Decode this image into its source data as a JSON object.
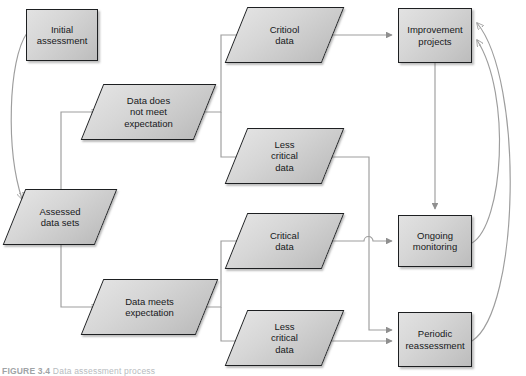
{
  "figure": {
    "caption_label": "FIGURE 3.4",
    "caption_text": "Data assessment process",
    "background_color": "#ffffff",
    "shape_fill": "#d6d6d6",
    "shape_border": "#1d1f21",
    "connector_color": "#9d9d9d",
    "text_color": "#16181a"
  },
  "nodes": {
    "initial_assessment": {
      "label": "Initial\nassessment",
      "shape": "rectangle",
      "x": 26,
      "y": 9,
      "w": 72,
      "h": 52
    },
    "assessed_data_sets": {
      "label": "Assessed\ndata sets",
      "shape": "parallelogram",
      "x": 14,
      "y": 189,
      "w": 92,
      "h": 56
    },
    "data_does_not_meet_expectation": {
      "label": "Data does\nnot meet\nexpectation",
      "shape": "parallelogram",
      "x": 92,
      "y": 84,
      "w": 113,
      "h": 56
    },
    "data_meets_expectation": {
      "label": "Data meets\nexpectation",
      "shape": "parallelogram",
      "x": 92,
      "y": 279,
      "w": 115,
      "h": 56
    },
    "critical_data_top": {
      "label": "Critiool\ndata",
      "shape": "parallelogram",
      "x": 236,
      "y": 7,
      "w": 97,
      "h": 56
    },
    "less_critical_data_top": {
      "label": "Less\ncritical\ndata",
      "shape": "parallelogram",
      "x": 236,
      "y": 128,
      "w": 97,
      "h": 56
    },
    "critical_data_bottom": {
      "label": "Critical\ndata",
      "shape": "parallelogram",
      "x": 236,
      "y": 213,
      "w": 97,
      "h": 56
    },
    "less_critical_data_bottom": {
      "label": "Less\ncritical\ndata",
      "shape": "parallelogram",
      "x": 236,
      "y": 310,
      "w": 97,
      "h": 56
    },
    "improvement_projects": {
      "label": "Improvement\nprojects",
      "shape": "rectangle",
      "x": 398,
      "y": 8,
      "w": 74,
      "h": 55
    },
    "ongoing_monitoring": {
      "label": "Ongoing\nmonitoring",
      "shape": "rectangle",
      "x": 398,
      "y": 215,
      "w": 74,
      "h": 52
    },
    "periodic_reassessment": {
      "label": "Periodic\nreassessment",
      "shape": "rectangle",
      "x": 398,
      "y": 312,
      "w": 74,
      "h": 55
    }
  },
  "edges": [
    {
      "name": "initial-assessment-to-assessed-data-sets",
      "from": "initial_assessment",
      "to": "assessed_data_sets",
      "style": "curve"
    },
    {
      "name": "assessed-data-sets-to-data-does-not-meet",
      "from": "assessed_data_sets",
      "to": "data_does_not_meet_expectation",
      "style": "elbow"
    },
    {
      "name": "assessed-data-sets-to-data-meets",
      "from": "assessed_data_sets",
      "to": "data_meets_expectation",
      "style": "elbow"
    },
    {
      "name": "data-does-not-meet-to-critical-data",
      "from": "data_does_not_meet_expectation",
      "to": "critical_data_top",
      "style": "elbow"
    },
    {
      "name": "data-does-not-meet-to-less-critical-data",
      "from": "data_does_not_meet_expectation",
      "to": "less_critical_data_top",
      "style": "elbow"
    },
    {
      "name": "data-meets-to-critical-data",
      "from": "data_meets_expectation",
      "to": "critical_data_bottom",
      "style": "elbow"
    },
    {
      "name": "data-meets-to-less-critical-data",
      "from": "data_meets_expectation",
      "to": "less_critical_data_bottom",
      "style": "elbow"
    },
    {
      "name": "critical-data-to-improvement-projects",
      "from": "critical_data_top",
      "to": "improvement_projects",
      "style": "straight"
    },
    {
      "name": "less-critical-data-to-periodic-reassessment",
      "from": "less_critical_data_top",
      "to": "periodic_reassessment",
      "style": "elbow-with-hop"
    },
    {
      "name": "critical-data-bottom-to-ongoing-monitoring",
      "from": "critical_data_bottom",
      "to": "ongoing_monitoring",
      "style": "straight"
    },
    {
      "name": "less-critical-data-bottom-to-periodic-reassessment",
      "from": "less_critical_data_bottom",
      "to": "periodic_reassessment",
      "style": "straight"
    },
    {
      "name": "improvement-projects-to-ongoing-monitoring",
      "from": "improvement_projects",
      "to": "ongoing_monitoring",
      "style": "straight"
    },
    {
      "name": "ongoing-monitoring-to-improvement-projects",
      "from": "ongoing_monitoring",
      "to": "improvement_projects",
      "style": "curve-feedback"
    },
    {
      "name": "periodic-reassessment-to-improvement-projects",
      "from": "periodic_reassessment",
      "to": "improvement_projects",
      "style": "curve-feedback"
    }
  ]
}
